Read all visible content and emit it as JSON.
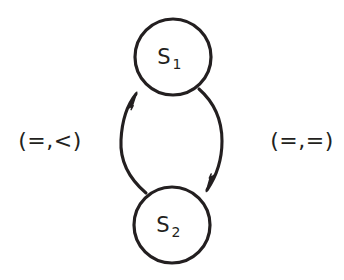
{
  "diagram": {
    "type": "state-transition-diagram",
    "background_color": "#ffffff",
    "stroke_color": "#231f20",
    "states": [
      {
        "id": "S1",
        "label_base": "S",
        "label_sub": "1",
        "cx": 173,
        "cy": 57,
        "r": 38
      },
      {
        "id": "S2",
        "label_base": "S",
        "label_sub": "2",
        "cx": 172,
        "cy": 225,
        "r": 38
      }
    ],
    "transitions": [
      {
        "id": "s2-to-s1",
        "from": "S2",
        "to": "S1",
        "label": "(=,<)",
        "label_side": "left",
        "label_x": 50,
        "label_y": 140,
        "arrowhead_x": 134,
        "arrowhead_y": 92
      },
      {
        "id": "s1-to-s2",
        "from": "S1",
        "to": "S2",
        "label": "(=,=)",
        "label_side": "right",
        "label_x": 302,
        "label_y": 140,
        "arrowhead_x": 209,
        "arrowhead_y": 189
      }
    ]
  }
}
